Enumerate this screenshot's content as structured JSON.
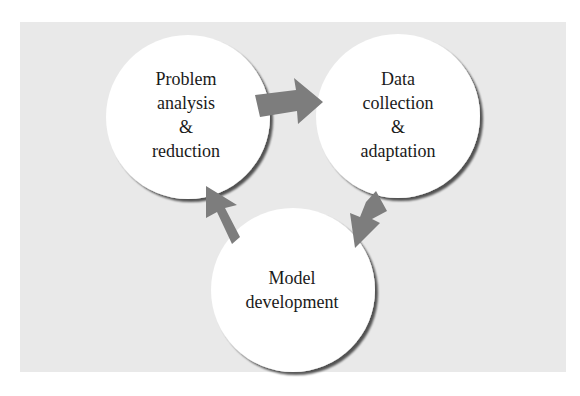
{
  "diagram": {
    "type": "cycle",
    "colors": {
      "panel_background": "#e9e9e9",
      "node_fill": "#ffffff",
      "node_shadow": "#7a7a7a",
      "arrow_fill": "#7d7d7d"
    },
    "nodes": [
      {
        "id": "problem",
        "lines": [
          "Problem",
          "analysis",
          "&",
          "reduction"
        ]
      },
      {
        "id": "data",
        "lines": [
          "Data",
          "collection",
          "&",
          "adaptation"
        ]
      },
      {
        "id": "model",
        "lines": [
          "Model",
          "development"
        ]
      }
    ],
    "edges": [
      {
        "from": "problem",
        "to": "data"
      },
      {
        "from": "data",
        "to": "model"
      },
      {
        "from": "model",
        "to": "problem"
      }
    ]
  }
}
